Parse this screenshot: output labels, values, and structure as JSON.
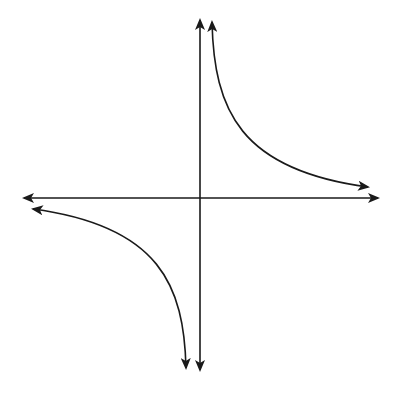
{
  "diagram": {
    "title": "",
    "type": "reciprocal function graph (hyperbola y = k/x)",
    "background": "#ffffff",
    "stroke_color": "#1a1a1a",
    "axes": {
      "x_axis": {
        "y": 198,
        "x_start": 22,
        "x_end": 380,
        "arrows": "both"
      },
      "y_axis": {
        "x": 200,
        "y_start": 18,
        "y_end": 372,
        "arrows": "both"
      }
    },
    "branches": [
      {
        "name": "quadrant-I-branch",
        "path": "M 212 22 C 214 110, 240 170, 368 187",
        "arrows": "both ends"
      },
      {
        "name": "quadrant-III-branch",
        "path": "M 33 209 C 160 226, 184 286, 186 368",
        "arrows": "both ends"
      }
    ]
  }
}
